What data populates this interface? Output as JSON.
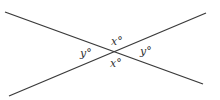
{
  "diagram": {
    "type": "intersecting-lines",
    "lines": [
      {
        "x1": 5,
        "y1": 12,
        "x2": 203,
        "y2": 84
      },
      {
        "x1": 9,
        "y1": 96,
        "x2": 206,
        "y2": 13
      }
    ],
    "labels": {
      "top": "x°",
      "left": "y°",
      "right": "y°",
      "bottom": "x°"
    },
    "colors": {
      "line": "#3a3a3a",
      "text": "#333333"
    }
  }
}
